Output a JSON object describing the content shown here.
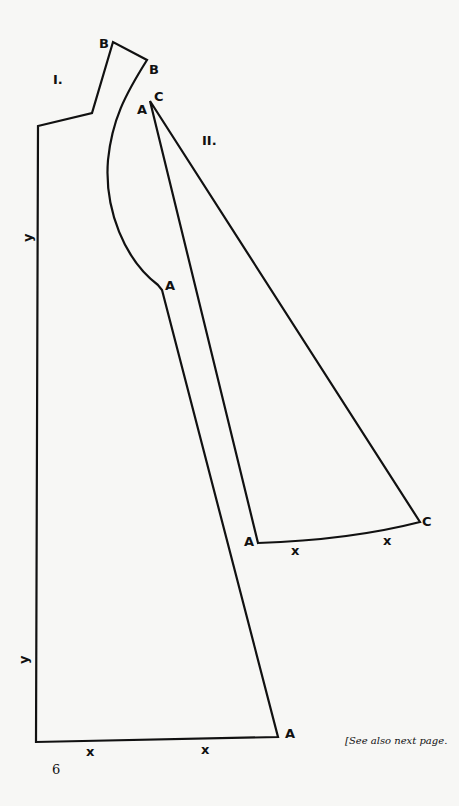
{
  "pieces": [
    {
      "id": "piece-1",
      "label": "I."
    },
    {
      "id": "piece-2",
      "label": "II."
    }
  ],
  "point_labels": {
    "B1": "B",
    "B2": "B",
    "C_top": "C",
    "A_top": "A",
    "A_mid": "A",
    "A_left2": "A",
    "C_right2": "C",
    "A_bottom": "A"
  },
  "marks": {
    "x": "x",
    "y": "y"
  },
  "page_number": "6",
  "footnote": "[See also next page."
}
